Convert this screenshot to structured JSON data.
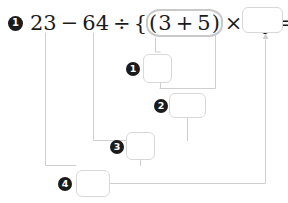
{
  "worksheet": {
    "problem_number": "1",
    "expression": {
      "tokens": [
        "23",
        "−",
        "64",
        "÷",
        "{",
        "(",
        "3",
        "+",
        "5",
        ")",
        "×",
        "4",
        "}",
        "="
      ],
      "lhs_first": "23",
      "minus": "−",
      "dividend": "64",
      "divide": "÷",
      "open_brace": "{",
      "open_paren": "(",
      "addend_a": "3",
      "plus": "+",
      "addend_b": "5",
      "close_paren": ")",
      "times": "×",
      "multiplier": "4",
      "close_brace": "}",
      "equals": "="
    },
    "highlight": {
      "name": "parenthesis-group-oval",
      "content": "(3 + 5)",
      "color": "#c9c9c9"
    },
    "steps": [
      {
        "label": "1",
        "value": "",
        "placeholder": ""
      },
      {
        "label": "2",
        "value": "",
        "placeholder": ""
      },
      {
        "label": "3",
        "value": "",
        "placeholder": ""
      },
      {
        "label": "4",
        "value": "",
        "placeholder": ""
      }
    ],
    "final_answer": {
      "label": "answer",
      "value": "",
      "placeholder": ""
    },
    "colors": {
      "ink": "#1b1b1b",
      "box_border": "#d8d8d8",
      "wire": "#cfcfcf",
      "marker_bg": "#1b1b1b",
      "marker_fg": "#ffffff",
      "background": "#ffffff"
    }
  }
}
